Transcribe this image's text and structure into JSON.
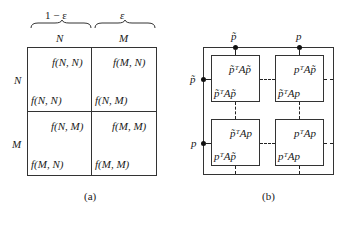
{
  "panel_a": {
    "caption": "(a)",
    "col_weights": [
      "1 − ε",
      "ε"
    ],
    "col_headers": [
      "N",
      "M"
    ],
    "row_headers": [
      "N",
      "M"
    ],
    "cells": [
      [
        {
          "top_right": "f(N, N)",
          "bottom_left": "f(N, N)"
        },
        {
          "top_right": "f(M, N)",
          "bottom_left": "f(N, M)"
        }
      ],
      [
        {
          "top_right": "f(N, M)",
          "bottom_left": "f(M, N)"
        },
        {
          "top_right": "f(M, M)",
          "bottom_left": "f(M, M)"
        }
      ]
    ]
  },
  "panel_b": {
    "caption": "(b)",
    "top_nodes": [
      "p̃",
      "p"
    ],
    "left_nodes": [
      "p̃",
      "p"
    ],
    "boxes": [
      [
        {
          "top_right": "p̃ᵀAp̃",
          "bottom_left": "p̃ᵀAp̃"
        },
        {
          "top_right": "pᵀAp̃",
          "bottom_left": "p̃ᵀAp"
        }
      ],
      [
        {
          "top_right": "p̃ᵀAp",
          "bottom_left": "pᵀAp̃"
        },
        {
          "top_right": "pᵀAp",
          "bottom_left": "pᵀAp"
        }
      ]
    ]
  }
}
